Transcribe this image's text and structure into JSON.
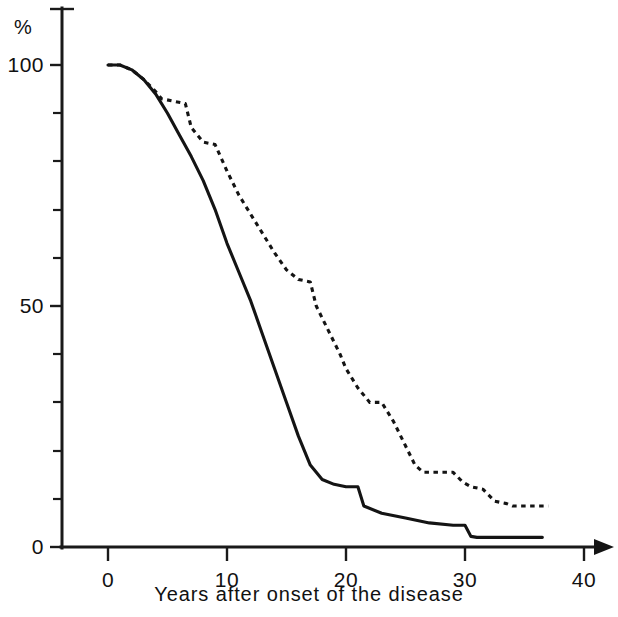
{
  "chart_data": {
    "type": "line",
    "title": "",
    "subtitle": "",
    "xlabel": "Years after onset of the disease",
    "ylabel": "%",
    "ylabel_position": "top-left-of-axis",
    "xlim": [
      0,
      40
    ],
    "ylim": [
      0,
      105
    ],
    "xticks": [
      0,
      10,
      20,
      30,
      40
    ],
    "xtick_labels": [
      "0",
      "10",
      "20",
      "30",
      "40"
    ],
    "yticks": [
      0,
      50,
      100
    ],
    "ytick_labels": [
      "0",
      "50",
      "100"
    ],
    "y_minor_ticks": [
      10,
      20,
      30,
      40,
      60,
      70,
      80,
      90
    ],
    "grid": false,
    "legend": false,
    "legend_position": "none",
    "axis_arrow_x": true,
    "series": [
      {
        "name": "solid-curve",
        "style": "solid",
        "color": "#141414",
        "x": [
          0.0,
          1.0,
          2.0,
          3.0,
          4.0,
          5.0,
          6.0,
          7.0,
          8.0,
          9.0,
          10.0,
          11.0,
          12.0,
          13.0,
          14.0,
          15.0,
          16.0,
          17.0,
          18.0,
          19.0,
          20.0,
          21.0,
          21.5,
          23.0,
          25.0,
          27.0,
          29.0,
          30.0,
          30.5,
          31.0,
          33.0,
          36.5
        ],
        "values": [
          100.0,
          100.0,
          99.0,
          97.0,
          94.0,
          90.0,
          85.5,
          81.0,
          76.0,
          70.0,
          63.0,
          57.0,
          51.0,
          44.0,
          37.0,
          30.0,
          23.0,
          17.0,
          14.0,
          13.0,
          12.5,
          12.5,
          8.5,
          7.0,
          6.0,
          5.0,
          4.5,
          4.5,
          2.2,
          2.0,
          2.0,
          2.0
        ]
      },
      {
        "name": "dashed-curve",
        "style": "dashed",
        "color": "#141414",
        "x": [
          0.0,
          1.0,
          2.0,
          3.0,
          4.0,
          4.5,
          5.5,
          6.5,
          7.0,
          8.0,
          9.0,
          10.0,
          11.0,
          12.0,
          13.0,
          14.0,
          15.0,
          16.0,
          17.0,
          17.5,
          18.5,
          19.5,
          20.0,
          21.0,
          22.0,
          23.0,
          24.0,
          25.0,
          25.8,
          26.5,
          29.0,
          29.8,
          30.5,
          31.5,
          32.5,
          33.5,
          34.0,
          37.0
        ],
        "values": [
          100.0,
          100.0,
          99.0,
          97.0,
          94.5,
          93.0,
          92.5,
          92.0,
          87.0,
          84.0,
          83.5,
          78.0,
          73.0,
          69.0,
          65.0,
          61.0,
          57.5,
          55.5,
          55.0,
          50.0,
          45.0,
          40.0,
          37.0,
          33.0,
          30.0,
          30.0,
          26.0,
          21.0,
          17.0,
          15.5,
          15.5,
          13.5,
          12.5,
          12.0,
          9.5,
          9.0,
          8.5,
          8.5
        ]
      }
    ],
    "annotations": []
  },
  "axis": {
    "unit_label": "%",
    "x_title": "Years after onset of the disease"
  }
}
